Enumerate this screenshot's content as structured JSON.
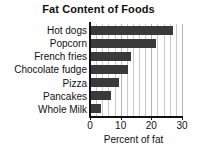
{
  "chart_data": {
    "type": "bar",
    "orientation": "horizontal",
    "title": "Fat Content of Foods",
    "xlabel": "Percent of fat",
    "ylabel": "",
    "categories": [
      "Hot dogs",
      "Popcorn",
      "French fries",
      "Chocolate fudge",
      "Pizza",
      "Pancakes",
      "Whole Milk"
    ],
    "values": [
      27,
      21.5,
      13.5,
      12.5,
      9.5,
      7,
      3.5
    ],
    "xlim": [
      0,
      30
    ],
    "xticks": [
      0,
      10,
      20,
      30
    ],
    "xtick_labels": [
      "0",
      "10",
      "20",
      "30"
    ],
    "minor_tick_step": 2,
    "grid": true,
    "grid_axis": "x",
    "legend": null,
    "bar_color": "#3a3a3a",
    "grid_color": "#c9c9c9",
    "axis_color": "#111111",
    "background": "#ffffff"
  }
}
